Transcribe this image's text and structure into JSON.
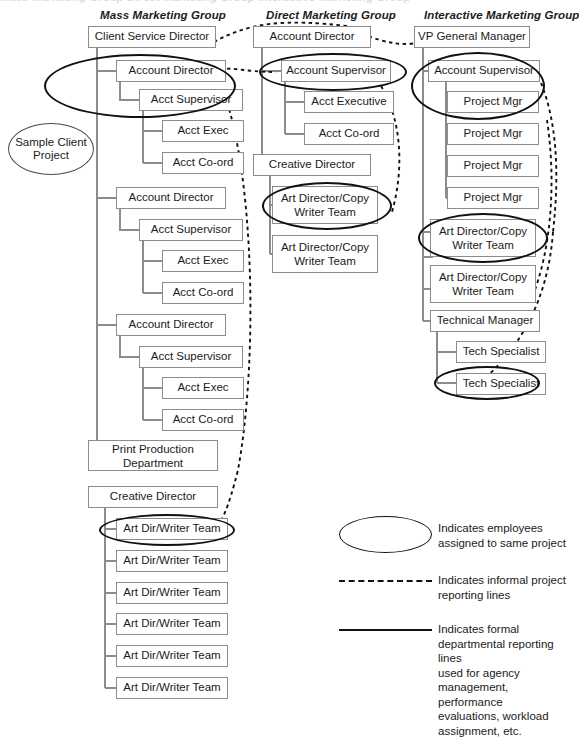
{
  "diagram": {
    "title_cropped": "Mass Marketing Group    Direct Marketing Group    Interactive Marketing Group",
    "sample_label_line1": "Sample Client",
    "sample_label_line2": "Project",
    "sample_label": "Sample Client Project",
    "groups": [
      {
        "id": "mass",
        "title": "Mass Marketing Group"
      },
      {
        "id": "direct",
        "title": "Direct Marketing Group"
      },
      {
        "id": "interactive",
        "title": "Interactive Marketing Group"
      }
    ]
  },
  "mass_column": {
    "head": "Client Service Director",
    "nodes": [
      "Account Director",
      "Acct Supervisor",
      "Acct Exec",
      "Acct Co-ord",
      "Account Director",
      "Acct Supervisor",
      "Acct Exec",
      "Acct Co-ord",
      "Account Director",
      "Acct Supervisor",
      "Acct Exec",
      "Acct Co-ord",
      "Print Production Department",
      "Creative Director",
      "Art Dir/Writer Team",
      "Art Dir/Writer Team",
      "Art Dir/Writer Team",
      "Art Dir/Writer Team",
      "Art Dir/Writer Team",
      "Art Dir/Writer Team"
    ],
    "print_production_line1": "Print Production",
    "print_production_line2": "Department"
  },
  "direct_column": {
    "head": "Account Director",
    "nodes": [
      "Account Supervisor",
      "Acct Executive",
      "Acct Co-ord",
      "Creative Director",
      "Art Director/Copy Writer Team",
      "Art Director/Copy Writer Team"
    ],
    "adcw_line1": "Art Director/Copy",
    "adcw_line2": "Writer Team"
  },
  "interactive_column": {
    "head": "VP General Manager",
    "nodes": [
      "Account Supervisor",
      "Project Mgr",
      "Project Mgr",
      "Project Mgr",
      "Project Mgr",
      "Art Director/Copy Writer Team",
      "Art Director/Copy Writer Team",
      "Technical Manager",
      "Tech Specialist",
      "Tech Specialist"
    ],
    "adcw_line1": "Art Director/Copy",
    "adcw_line2": "Writer Team"
  },
  "legend": {
    "ellipse_text_line1": "Indicates employees",
    "ellipse_text_line2": "assigned to same project",
    "ellipse_text": "Indicates employees assigned to same project",
    "dashed_text_line1": "Indicates informal project",
    "dashed_text_line2": "reporting lines",
    "dashed_text": "Indicates informal project reporting lines",
    "solid_text_line1": "Indicates formal",
    "solid_text_line2": "departmental reporting lines",
    "solid_text_line3": "used for agency",
    "solid_text_line4": "management, performance",
    "solid_text_line5": "evaluations, workload",
    "solid_text_line6": "assignment, etc.",
    "solid_text": "Indicates formal departmental reporting lines used for agency management, performance evaluations, workload assignment, etc."
  },
  "colors": {
    "box_border": "#8c8c8c",
    "line": "#8c8c8c",
    "ellipse": "#111111",
    "text": "#1b1b1b",
    "background": "#ffffff"
  }
}
